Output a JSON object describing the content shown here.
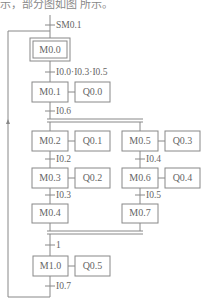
{
  "caption_fragment": "示，部分图如图 所示。",
  "diagram": {
    "type": "sequential-function-chart",
    "initial_step": {
      "label": "M0.0",
      "initial_condition": "SM0.1"
    },
    "steps": [
      {
        "id": "M0.0",
        "action": null
      },
      {
        "id": "M0.1",
        "action": "Q0.0"
      },
      {
        "id": "M0.2",
        "action": "Q0.1"
      },
      {
        "id": "M0.3",
        "action": "Q0.2"
      },
      {
        "id": "M0.4",
        "action": null
      },
      {
        "id": "M0.5",
        "action": "Q0.3"
      },
      {
        "id": "M0.6",
        "action": "Q0.4"
      },
      {
        "id": "M0.7",
        "action": null
      },
      {
        "id": "M1.0",
        "action": "Q0.5"
      }
    ],
    "transitions": {
      "t_init": "SM0.1",
      "t0": "I0.0·I0.3·I0.5",
      "t1": "I0.6",
      "t2": "I0.2",
      "t3": "I0.3",
      "t4": "I0.4",
      "t5": "I0.5",
      "t6": "1",
      "t7": "I0.7"
    },
    "labels": {
      "m00": "M0.0",
      "m01": "M0.1",
      "q00": "Q0.0",
      "m02": "M0.2",
      "q01": "Q0.1",
      "m05": "M0.5",
      "q03": "Q0.3",
      "m03": "M0.3",
      "q02": "Q0.2",
      "m06": "M0.6",
      "q04": "Q0.4",
      "m04": "M0.4",
      "m07": "M0.7",
      "m10": "M1.0",
      "q05": "Q0.5"
    }
  }
}
